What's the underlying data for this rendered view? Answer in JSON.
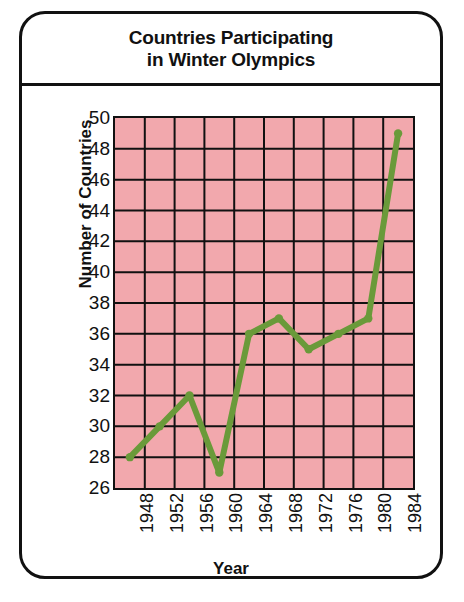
{
  "card": {
    "title_lines": [
      "Countries Participating",
      "in Winter Olympics"
    ]
  },
  "colors": {
    "plot_background": "#f2a8ad",
    "grid": "#111111",
    "line": "#6a9a3a",
    "border": "#111111",
    "text": "#111111"
  },
  "chart_data": {
    "type": "line",
    "title": "Countries Participating in Winter Olympics",
    "xlabel": "Year",
    "ylabel": "Number of Countries",
    "categories": [
      "1948",
      "1952",
      "1956",
      "1960",
      "1964",
      "1968",
      "1972",
      "1976",
      "1980",
      "1984"
    ],
    "x": [
      1948,
      1952,
      1956,
      1960,
      1964,
      1968,
      1972,
      1976,
      1980,
      1984
    ],
    "values": [
      28,
      30,
      32,
      27,
      36,
      37,
      35,
      36,
      37,
      49
    ],
    "ylim": [
      26,
      50
    ],
    "ytick_step": 2,
    "yticks": [
      50,
      48,
      46,
      44,
      42,
      40,
      38,
      36,
      34,
      32,
      30,
      28,
      26
    ],
    "grid": true,
    "legend": null,
    "marker": "dot",
    "line_color": "#6a9a3a"
  }
}
